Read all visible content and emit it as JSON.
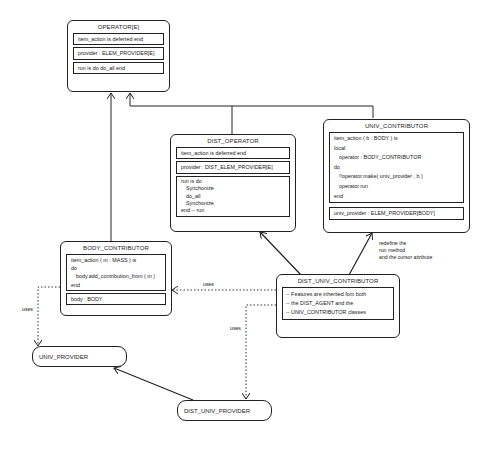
{
  "classes": {
    "operator": {
      "title": "OPERATOR[E]",
      "sections": [
        "item_action is deferred end",
        "provider : ELEM_PROVIDER[E]",
        "run is do do_all end"
      ]
    },
    "dist_operator": {
      "title": "DIST_OPERATOR",
      "section1": "item_action is deferred end",
      "section2": "provider : DIST_ELEM_PROVIDER[E]",
      "run_lines": [
        "run is do",
        "Synchonize",
        "do_all",
        "Synchonize",
        "end -- run"
      ]
    },
    "univ_contributor": {
      "title": "UNIV_CONTRIBUTOR",
      "body_lines": [
        "item_action ( b : BODY ) is",
        "local",
        "operator : BODY_CONTRIBUTOR",
        "do",
        "!!operator.make( univ_provider , b )",
        "operator.run",
        "end"
      ],
      "attr": "univ_provider : ELEM_PROVIDER[BODY]"
    },
    "body_contributor": {
      "title": "BODY_CONTRIBUTOR",
      "body_lines": [
        "item_action ( m : MASS ) is",
        "do",
        "body.add_contribution_from ( m )",
        "end"
      ],
      "attr": "body : BODY"
    },
    "dist_univ_contributor": {
      "title": "DIST_UNIV_CONTRIBUTOR",
      "notes": [
        "-- Features are inherited fom both",
        "-- the DIST_AGENT and the",
        "-- UNIV_CONTRIBUTOR classes"
      ]
    }
  },
  "providers": {
    "univ_provider": "UNIV_PROVIDER",
    "dist_univ_provider": "DIST_UNIV_PROVIDER"
  },
  "labels": {
    "uses_left": "uses",
    "uses_middle": "uses",
    "uses_bottom": "uses",
    "redefine": [
      "redefine the",
      "run method",
      "and the cursor attribute"
    ]
  },
  "colors": {
    "line": "#222222",
    "background": "#ffffff"
  }
}
